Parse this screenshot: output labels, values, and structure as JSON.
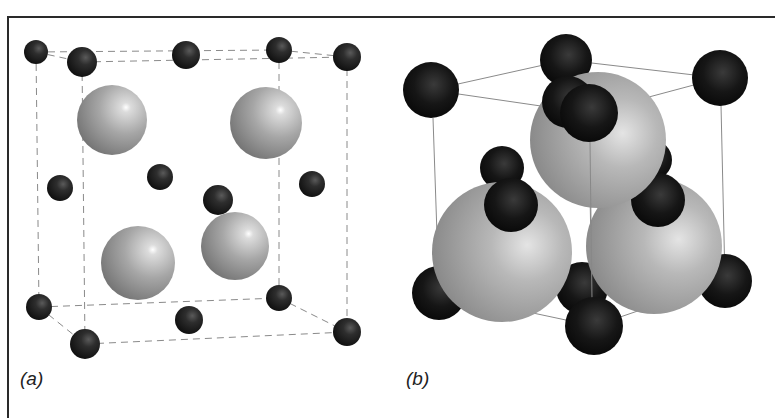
{
  "figure": {
    "panels": [
      {
        "id": "a",
        "label": "(a)",
        "description": "Unit cell with dashed cube edges, 14 small dark atoms and 4 large light-gray atoms",
        "edge_style": "dashed",
        "small_atoms": [
          [
            36,
            52,
            12
          ],
          [
            82,
            62,
            15
          ],
          [
            186,
            55,
            14
          ],
          [
            279,
            50,
            13
          ],
          [
            347,
            57,
            14
          ],
          [
            60,
            188,
            13
          ],
          [
            160,
            177,
            13
          ],
          [
            218,
            200,
            15
          ],
          [
            312,
            184,
            13
          ],
          [
            39,
            307,
            13
          ],
          [
            85,
            344,
            15
          ],
          [
            189,
            320,
            14
          ],
          [
            279,
            298,
            13
          ],
          [
            347,
            332,
            14
          ]
        ],
        "large_atoms": [
          [
            112,
            120,
            35
          ],
          [
            266,
            123,
            36
          ],
          [
            138,
            263,
            37
          ],
          [
            235,
            246,
            34
          ]
        ]
      },
      {
        "id": "b",
        "label": "(b)",
        "description": "Space-filling unit cell with solid cube edges, large light-gray atoms packed with dark atoms",
        "edge_style": "solid"
      }
    ],
    "colors": {
      "small_atom": "#1e1e1e",
      "large_atom": "#a8a8a8",
      "edge": "#8a8a8a",
      "frame": "#2a2a2a"
    }
  }
}
